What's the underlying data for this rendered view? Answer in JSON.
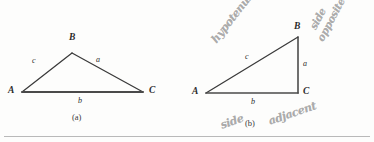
{
  "figure": {
    "type": "geometry-diagram",
    "background_color": "#fdfdfc",
    "stroke_color": "#3a3a3a",
    "handwriting_color": "#9a9a9a",
    "panels": [
      {
        "caption": "(a)",
        "description": "oblique triangle",
        "vertices": [
          {
            "label": "A",
            "x": 22,
            "y": 92
          },
          {
            "label": "B",
            "x": 72,
            "y": 53
          },
          {
            "label": "C",
            "x": 143,
            "y": 92
          }
        ],
        "sides": [
          {
            "label": "c",
            "between": "A-B"
          },
          {
            "label": "a",
            "between": "B-C"
          },
          {
            "label": "b",
            "between": "A-C"
          }
        ]
      },
      {
        "caption": "(b)",
        "description": "right triangle with right angle at C",
        "vertices": [
          {
            "label": "A",
            "x": 206,
            "y": 93
          },
          {
            "label": "B",
            "x": 298,
            "y": 37
          },
          {
            "label": "C",
            "x": 298,
            "y": 93
          }
        ],
        "sides": [
          {
            "label": "c",
            "between": "A-B"
          },
          {
            "label": "a",
            "between": "B-C"
          },
          {
            "label": "b",
            "between": "A-C"
          }
        ]
      }
    ],
    "annotations": [
      {
        "name": "hypotenuse",
        "text": "hypotenuse",
        "points_to": "c",
        "style": "handwritten"
      },
      {
        "name": "side-opposite",
        "text_line1": "side",
        "text_line2": "opposite",
        "points_to": "a",
        "style": "handwritten"
      },
      {
        "name": "side-adjacent",
        "text_line1": "side",
        "text_line2": "adjacent",
        "points_to": "b",
        "style": "handwritten"
      }
    ]
  }
}
